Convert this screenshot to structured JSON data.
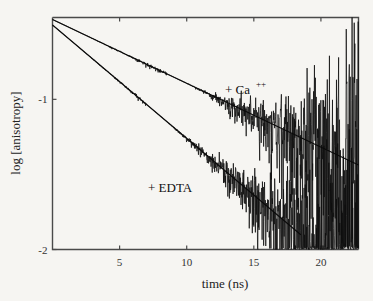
{
  "chart_data": {
    "type": "line",
    "title": "",
    "xlabel": "time (ns)",
    "ylabel": "log [anisotropy]",
    "xlim": [
      0,
      22.8
    ],
    "ylim": [
      -2.0,
      -0.455
    ],
    "xticks": [
      5,
      10,
      15,
      20
    ],
    "xticklabels": [
      "5",
      "10",
      "15",
      "20"
    ],
    "yticks": [
      -1,
      -2
    ],
    "yticklabels": [
      "-1",
      "-2"
    ],
    "grid": false,
    "legend_position": "inline-annotations",
    "annotations": [
      {
        "text": "+ Ca",
        "superscript": "++",
        "x": 13.0,
        "y": -0.86
      },
      {
        "text": "+ EDTA",
        "superscript": "",
        "x": 7.6,
        "y": -1.53
      }
    ],
    "series": [
      {
        "name": "+ Ca++",
        "label": "+ Ca++",
        "color": "#0d0d0d",
        "type": "decay-with-noise",
        "intercept": -0.468,
        "slope_per_ns": -0.0425,
        "noise_onset_ns": 8.5,
        "noise_scale": 0.3,
        "fit_x": [
          0.0,
          22.8
        ],
        "fit_y": [
          -0.468,
          -1.437
        ]
      },
      {
        "name": "+ EDTA",
        "label": "+ EDTA",
        "color": "#0d0d0d",
        "type": "decay-with-noise",
        "intercept": -0.505,
        "slope_per_ns": -0.0755,
        "noise_onset_ns": 7.0,
        "noise_scale": 0.36,
        "fit_x": [
          0.0,
          18.5
        ],
        "fit_y": [
          -0.505,
          -1.902
        ]
      }
    ]
  },
  "axes": {
    "x_axis_name": "time-axis",
    "y_axis_name": "log-anisotropy-axis",
    "frame_color": "#4a4a4a",
    "background": "#f6f5f2"
  }
}
